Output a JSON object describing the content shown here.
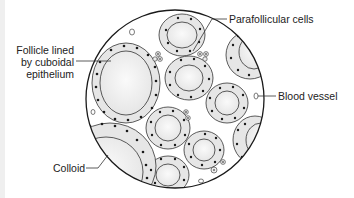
{
  "figure": {
    "labels": {
      "follicle": [
        "Follicle lined",
        "by cuboidal",
        "epithelium"
      ],
      "parafollicular": "Parafollicular cells",
      "blood_vessel": "Blood vessel",
      "colloid": "Colloid"
    }
  },
  "colors": {
    "outline": "#222222",
    "epithelium_fill": "#e6e6e6",
    "colloid_fill": "#f4f4f4",
    "nucleus": "#1a1a1a",
    "background": "#ffffff"
  }
}
